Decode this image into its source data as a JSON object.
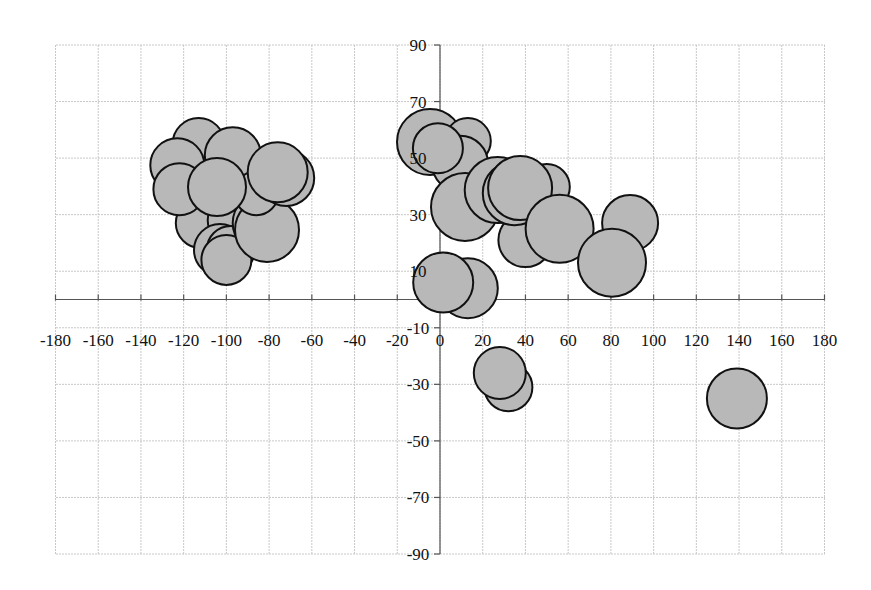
{
  "chart_data": {
    "type": "bubble",
    "title": "",
    "xlabel": "",
    "ylabel": "",
    "xlim": [
      -180,
      180
    ],
    "ylim": [
      -90,
      90
    ],
    "grid": true,
    "legend": null,
    "x_ticks": [
      -180,
      -160,
      -140,
      -120,
      -100,
      -80,
      -60,
      -40,
      -20,
      0,
      20,
      40,
      60,
      80,
      100,
      120,
      140,
      160,
      180
    ],
    "y_ticks": [
      90,
      70,
      50,
      30,
      10,
      -10,
      -30,
      -50,
      -70,
      -90
    ],
    "colors": {
      "fill": "#b8b8b8",
      "stroke": "#111111",
      "grid": "#c8c8c8"
    },
    "points": [
      {
        "x": -113,
        "y": 55,
        "r": 26
      },
      {
        "x": -97,
        "y": 51,
        "r": 28
      },
      {
        "x": -123,
        "y": 47.5,
        "r": 27
      },
      {
        "x": -112,
        "y": 27,
        "r": 25
      },
      {
        "x": -98,
        "y": 28,
        "r": 23
      },
      {
        "x": -103,
        "y": 17.5,
        "r": 26
      },
      {
        "x": -98,
        "y": 17.5,
        "r": 24
      },
      {
        "x": -100,
        "y": 14,
        "r": 25
      },
      {
        "x": -83,
        "y": 27,
        "r": 30
      },
      {
        "x": -81,
        "y": 24.6,
        "r": 32
      },
      {
        "x": -86,
        "y": 37.6,
        "r": 22
      },
      {
        "x": -122,
        "y": 39,
        "r": 26
      },
      {
        "x": -72,
        "y": 43,
        "r": 28
      },
      {
        "x": -76,
        "y": 45,
        "r": 30
      },
      {
        "x": -104.4,
        "y": 39.8,
        "r": 29
      },
      {
        "x": -4.7,
        "y": 55.7,
        "r": 33
      },
      {
        "x": 13,
        "y": 56,
        "r": 23
      },
      {
        "x": 9.4,
        "y": 48,
        "r": 28
      },
      {
        "x": -1,
        "y": 53.5,
        "r": 25
      },
      {
        "x": 11.7,
        "y": 32.7,
        "r": 34
      },
      {
        "x": 50,
        "y": 39.8,
        "r": 23
      },
      {
        "x": 40,
        "y": 21,
        "r": 27
      },
      {
        "x": 27,
        "y": 38.7,
        "r": 33
      },
      {
        "x": 35,
        "y": 37.6,
        "r": 32
      },
      {
        "x": 37.5,
        "y": 39.4,
        "r": 32
      },
      {
        "x": 56,
        "y": 25,
        "r": 34
      },
      {
        "x": 89,
        "y": 27,
        "r": 28
      },
      {
        "x": 80.5,
        "y": 13,
        "r": 34
      },
      {
        "x": 13,
        "y": 4,
        "r": 30
      },
      {
        "x": 1.5,
        "y": 6,
        "r": 30
      },
      {
        "x": 32,
        "y": -31,
        "r": 24
      },
      {
        "x": 28,
        "y": -26,
        "r": 26
      },
      {
        "x": 139,
        "y": -35,
        "r": 30
      }
    ]
  }
}
